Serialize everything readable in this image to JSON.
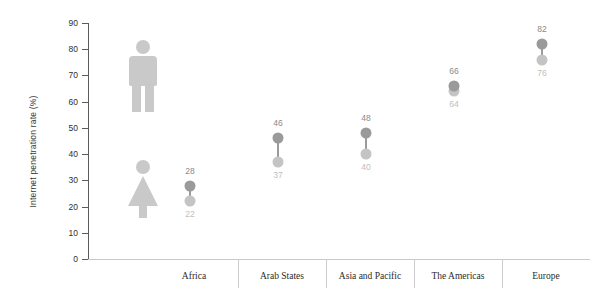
{
  "chart_data": {
    "type": "scatter",
    "title": "",
    "xlabel": "",
    "ylabel": "Internet penetration rate (%)",
    "ylim": [
      0,
      90
    ],
    "ytick_labels": [
      "90",
      "80",
      "70",
      "60",
      "50",
      "40",
      "30",
      "20",
      "10",
      "0"
    ],
    "yticks": [
      90,
      80,
      70,
      60,
      50,
      40,
      30,
      20,
      10,
      0
    ],
    "grid": false,
    "legend_position": "plot-left-pictograms",
    "categories": [
      "Africa",
      "Arab States",
      "Asia and Pacific",
      "The Americas",
      "Europe"
    ],
    "series": [
      {
        "name": "Male",
        "values": [
          28,
          46,
          48,
          66,
          82
        ],
        "color": "#9a9a9a"
      },
      {
        "name": "Female",
        "values": [
          22,
          37,
          40,
          64,
          76
        ],
        "color": "#c4c4c4"
      }
    ],
    "points": [
      {
        "category": "Africa",
        "male": 28,
        "female": 22
      },
      {
        "category": "Arab States",
        "male": 46,
        "female": 37
      },
      {
        "category": "Asia and Pacific",
        "male": 48,
        "female": 40
      },
      {
        "category": "The Americas",
        "male": 66,
        "female": 64
      },
      {
        "category": "Europe",
        "male": 82,
        "female": 76
      }
    ]
  },
  "axis": {
    "y_title": "Internet penetration rate (%)",
    "y_labels": [
      "90",
      "80",
      "70",
      "60",
      "50",
      "40",
      "30",
      "20",
      "10",
      "0"
    ]
  },
  "legend": {
    "male_icon": "male-pictogram",
    "female_icon": "female-pictogram"
  },
  "categories": [
    {
      "label": "Africa"
    },
    {
      "label": "Arab States"
    },
    {
      "label": "Asia and Pacific"
    },
    {
      "label": "The Americas"
    },
    {
      "label": "Europe"
    }
  ],
  "values": {
    "africa_male": "28",
    "africa_female": "22",
    "arab_male": "46",
    "arab_female": "37",
    "asia_male": "48",
    "asia_female": "40",
    "americas_male": "66",
    "americas_female": "64",
    "europe_male": "82",
    "europe_female": "76"
  }
}
